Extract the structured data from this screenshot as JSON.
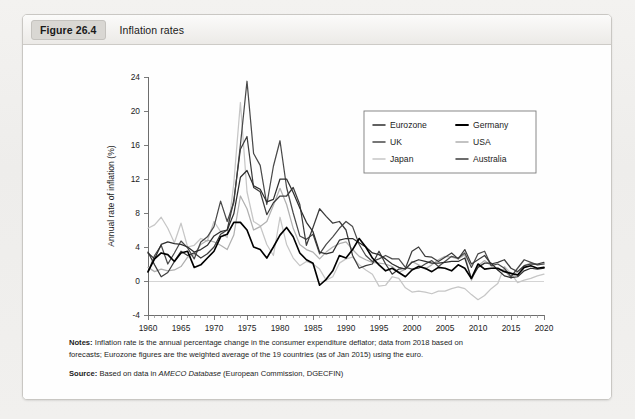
{
  "figure": {
    "tag": "Figure 26.4",
    "title": "Inflation rates"
  },
  "notes": {
    "notes_label": "Notes:",
    "notes_line1": "Inflation rate is the annual percentage change in the consumer expenditure deflator; data from 2018 based on",
    "notes_line2_pre": "forecasts; Eurozone figures are the weighted average of the 19 countries (as of Jan 2015) using the euro.",
    "source_label": "Source:",
    "source_pre": "Based on data in ",
    "source_italic": "AMECO Database",
    "source_post": " (European Commission, DGECFIN)"
  },
  "chart_data": {
    "type": "line",
    "title": "Inflation rates",
    "xlabel": "",
    "ylabel": "Annual rate of inflation (%)",
    "xlim": [
      1960,
      2020
    ],
    "ylim": [
      -4,
      24
    ],
    "ytick_step": 4,
    "yticks": [
      -4,
      0,
      4,
      8,
      12,
      16,
      20,
      24
    ],
    "xticks": [
      1960,
      1965,
      1970,
      1975,
      1980,
      1985,
      1990,
      1995,
      2000,
      2005,
      2010,
      2015,
      2020
    ],
    "x_minor_tick_step": 1,
    "grid": false,
    "zero_reference_line": true,
    "legend_position": "top-right",
    "legend_columns": 2,
    "x": [
      1960,
      1961,
      1962,
      1963,
      1964,
      1965,
      1966,
      1967,
      1968,
      1969,
      1970,
      1971,
      1972,
      1973,
      1974,
      1975,
      1976,
      1977,
      1978,
      1979,
      1980,
      1981,
      1982,
      1983,
      1984,
      1985,
      1986,
      1987,
      1988,
      1989,
      1990,
      1991,
      1992,
      1993,
      1994,
      1995,
      1996,
      1997,
      1998,
      1999,
      2000,
      2001,
      2002,
      2003,
      2004,
      2005,
      2006,
      2007,
      2008,
      2009,
      2010,
      2011,
      2012,
      2013,
      2014,
      2015,
      2016,
      2017,
      2018,
      2019,
      2020
    ],
    "series": [
      {
        "name": "Eurozone",
        "color": "#2e2e2e",
        "width": 1.25,
        "values": [
          3.3,
          2.6,
          4.3,
          4.6,
          4.4,
          4.3,
          4.0,
          3.4,
          3.7,
          4.2,
          5.3,
          5.8,
          6.0,
          7.9,
          12.2,
          13.0,
          11.2,
          10.8,
          9.3,
          9.6,
          12.0,
          12.0,
          10.4,
          8.6,
          6.9,
          5.8,
          3.4,
          3.2,
          3.4,
          4.8,
          5.0,
          5.0,
          4.5,
          4.0,
          3.3,
          3.1,
          2.6,
          2.0,
          1.6,
          1.4,
          2.2,
          2.5,
          2.3,
          2.1,
          2.1,
          2.2,
          2.3,
          2.3,
          2.7,
          0.3,
          1.6,
          2.1,
          2.1,
          1.3,
          0.6,
          0.4,
          0.5,
          1.2,
          1.5,
          1.4,
          1.5
        ]
      },
      {
        "name": "Germany",
        "color": "#000000",
        "width": 1.65,
        "values": [
          1.1,
          2.6,
          3.3,
          3.1,
          2.3,
          3.3,
          3.5,
          1.6,
          1.9,
          2.7,
          3.5,
          5.2,
          5.5,
          6.9,
          6.9,
          6.0,
          4.0,
          3.7,
          2.7,
          4.0,
          5.4,
          6.3,
          5.2,
          3.3,
          2.5,
          2.1,
          -0.5,
          0.2,
          1.2,
          3.0,
          2.7,
          3.7,
          5.0,
          4.0,
          2.7,
          1.9,
          1.2,
          1.5,
          1.0,
          0.5,
          1.3,
          1.7,
          1.5,
          1.1,
          1.6,
          1.5,
          1.2,
          1.9,
          1.5,
          0.3,
          2.0,
          1.4,
          1.5,
          1.5,
          1.1,
          0.9,
          0.7,
          1.6,
          1.8,
          1.5,
          1.6
        ]
      },
      {
        "name": "UK",
        "color": "#4a4a4a",
        "width": 1.25,
        "values": [
          1.0,
          3.0,
          4.2,
          2.0,
          3.3,
          4.7,
          3.9,
          2.6,
          4.6,
          5.2,
          6.4,
          9.4,
          7.0,
          9.2,
          16.0,
          23.5,
          15.0,
          13.6,
          9.0,
          13.5,
          16.5,
          11.0,
          8.0,
          5.3,
          4.9,
          5.5,
          3.2,
          4.3,
          5.2,
          6.2,
          7.0,
          6.4,
          4.3,
          3.0,
          2.3,
          2.6,
          3.0,
          2.6,
          2.6,
          1.6,
          1.4,
          1.5,
          2.0,
          2.4,
          1.7,
          2.3,
          2.9,
          2.7,
          3.3,
          1.6,
          3.2,
          3.5,
          1.8,
          2.0,
          1.5,
          0.5,
          1.5,
          2.5,
          2.2,
          1.9,
          2.0
        ]
      },
      {
        "name": "USA",
        "color": "#b0b0b0",
        "width": 1.25,
        "values": [
          1.6,
          1.1,
          1.4,
          1.2,
          1.3,
          1.7,
          2.8,
          3.1,
          4.3,
          4.8,
          4.6,
          4.2,
          3.7,
          5.4,
          10.0,
          8.5,
          6.0,
          6.4,
          7.0,
          8.9,
          10.9,
          9.0,
          6.2,
          4.3,
          3.7,
          3.4,
          2.6,
          3.4,
          4.0,
          4.4,
          4.6,
          3.7,
          2.9,
          2.5,
          2.2,
          2.1,
          2.0,
          1.7,
          1.0,
          1.4,
          2.3,
          1.9,
          1.4,
          1.9,
          2.5,
          2.9,
          2.8,
          2.6,
          3.1,
          0.1,
          1.8,
          2.4,
          1.8,
          1.3,
          1.3,
          0.3,
          1.1,
          1.8,
          2.1,
          1.9,
          2.0
        ]
      },
      {
        "name": "Japan",
        "color": "#c6c6c6",
        "width": 1.25,
        "values": [
          6.2,
          6.6,
          7.5,
          6.2,
          4.5,
          6.8,
          4.0,
          4.2,
          5.0,
          4.7,
          7.0,
          5.8,
          5.1,
          11.5,
          21.0,
          10.5,
          7.0,
          6.5,
          4.3,
          3.0,
          7.5,
          4.3,
          2.7,
          1.8,
          2.3,
          2.0,
          1.4,
          0.1,
          0.5,
          2.1,
          2.6,
          2.8,
          1.9,
          1.3,
          0.8,
          -0.6,
          -0.5,
          0.5,
          0.3,
          -0.8,
          -1.3,
          -1.2,
          -1.3,
          -1.5,
          -1.2,
          -1.2,
          -0.9,
          -0.7,
          -0.9,
          -1.6,
          -2.2,
          -1.7,
          -0.9,
          -0.3,
          1.7,
          0.9,
          -0.2,
          0.1,
          0.3,
          0.6,
          0.8
        ]
      },
      {
        "name": "Australia",
        "color": "#3c3c3c",
        "width": 1.25,
        "values": [
          3.4,
          1.9,
          0.5,
          1.0,
          2.3,
          3.5,
          3.0,
          3.3,
          2.7,
          3.2,
          4.0,
          5.5,
          6.0,
          9.5,
          15.5,
          17.0,
          11.0,
          10.5,
          7.8,
          9.2,
          10.0,
          10.0,
          11.0,
          9.0,
          4.2,
          6.3,
          8.5,
          7.6,
          6.8,
          7.0,
          6.0,
          3.0,
          1.5,
          1.8,
          2.0,
          3.5,
          2.0,
          0.8,
          1.4,
          1.5,
          3.5,
          4.0,
          2.9,
          2.8,
          2.3,
          2.8,
          3.3,
          2.6,
          3.7,
          2.0,
          2.5,
          3.0,
          2.0,
          2.2,
          2.5,
          1.5,
          1.1,
          1.8,
          2.0,
          2.0,
          2.2
        ]
      }
    ]
  },
  "legend": {
    "entries": [
      {
        "label": "Eurozone",
        "color": "#2e2e2e"
      },
      {
        "label": "Germany",
        "color": "#000000"
      },
      {
        "label": "UK",
        "color": "#4a4a4a"
      },
      {
        "label": "USA",
        "color": "#b0b0b0"
      },
      {
        "label": "Japan",
        "color": "#c6c6c6"
      },
      {
        "label": "Australia",
        "color": "#3c3c3c"
      }
    ]
  }
}
